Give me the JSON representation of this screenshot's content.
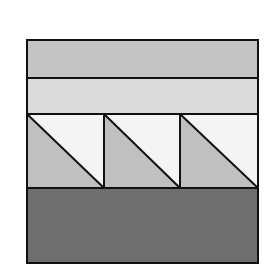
{
  "diagram": {
    "type": "quilt-block",
    "frame": {
      "x": 27,
      "y": 40,
      "width": 231,
      "height": 223
    },
    "stroke": "#111111",
    "colors": {
      "top_strip": "#c4c4c4",
      "second_strip": "#dadada",
      "triangle_light": "#f4f4f4",
      "triangle_medium": "#c0c0c0",
      "bottom_strip": "#6e6e6e"
    },
    "rows": [
      {
        "name": "top-strip",
        "y": 40,
        "height": 38
      },
      {
        "name": "second-strip",
        "y": 78,
        "height": 36
      },
      {
        "name": "triangle-row",
        "y": 114,
        "height": 74,
        "units": 3
      },
      {
        "name": "bottom-strip",
        "y": 188,
        "height": 75
      }
    ],
    "triangle_columns": [
      27,
      104,
      180,
      258
    ]
  }
}
